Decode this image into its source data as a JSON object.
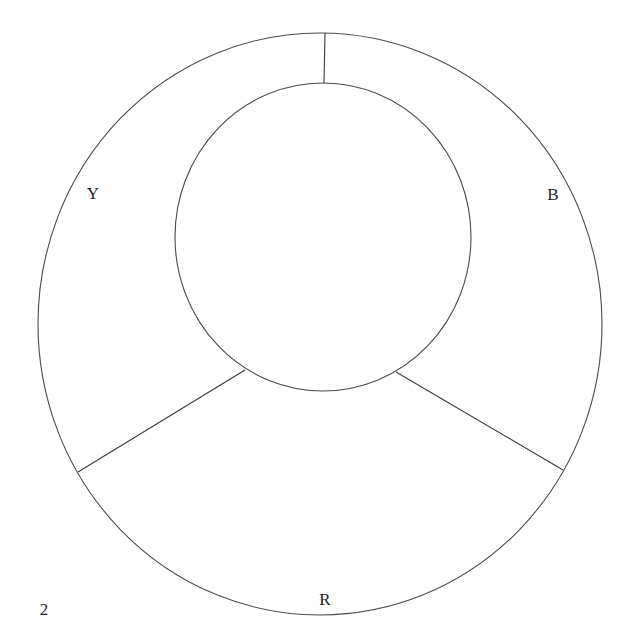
{
  "figure": {
    "number": "2",
    "segments": [
      {
        "label": "Y",
        "position": "upper-left"
      },
      {
        "label": "B",
        "position": "upper-right"
      },
      {
        "label": "R",
        "position": "bottom"
      }
    ]
  },
  "colors": {
    "stroke": "#4a4a4a",
    "text": "#1e1e1e",
    "background": "#ffffff"
  }
}
